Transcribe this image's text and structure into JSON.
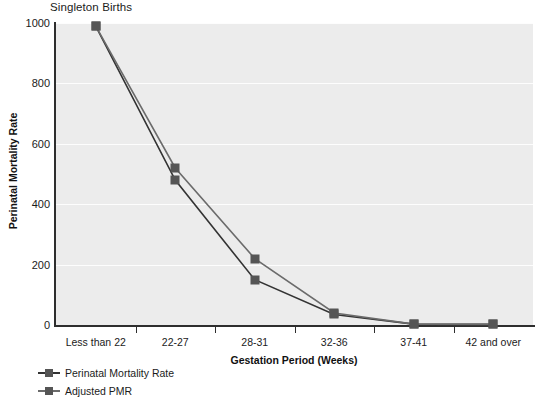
{
  "chart_data": {
    "type": "line",
    "title": "Singleton Births",
    "xlabel": "Gestation Period (Weeks)",
    "ylabel": "Perinatal Mortality Rate",
    "categories": [
      "Less than 22",
      "22-27",
      "28-31",
      "32-36",
      "37-41",
      "42 and over"
    ],
    "series": [
      {
        "name": "Perinatal Mortality Rate",
        "color": "#333333",
        "values": [
          990,
          480,
          150,
          35,
          3,
          2
        ]
      },
      {
        "name": "Adjusted PMR",
        "color": "#6b6b6b",
        "values": [
          990,
          520,
          220,
          40,
          3,
          2
        ]
      }
    ],
    "ylim": [
      0,
      1000
    ],
    "yticks": [
      "0",
      "200",
      "400",
      "600",
      "800",
      "1000"
    ],
    "ytick_values": [
      0,
      200,
      400,
      600,
      800,
      1000
    ],
    "grid": true,
    "legend_position": "below-left",
    "plot_background": "#ececec",
    "axis_color": "#2e2e2e",
    "marker_color": "#555555"
  },
  "legend": {
    "items": [
      {
        "label": "Perinatal Mortality Rate"
      },
      {
        "label": "Adjusted PMR"
      }
    ]
  }
}
